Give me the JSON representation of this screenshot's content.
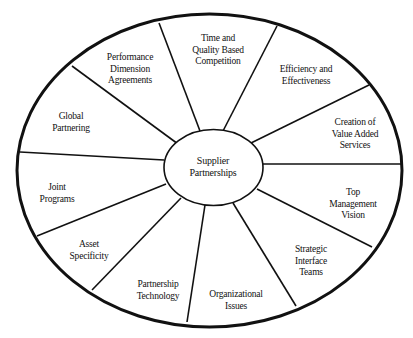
{
  "diagram": {
    "type": "wheel",
    "stroke_color": "#111111",
    "background": "#ffffff",
    "outer_ellipse": {
      "cx": 209.5,
      "cy": 170.5,
      "rx": 192.5,
      "ry": 156.5
    },
    "inner_ellipse": {
      "cx": 213.5,
      "cy": 167.5,
      "rx": 49.5,
      "ry": 38
    },
    "center": {
      "lines": [
        "Supplier",
        "Partnerships"
      ],
      "x": 213,
      "y": 167
    },
    "segments": [
      {
        "id": "time-quality",
        "lines": [
          "Time and",
          "Quality Based",
          "Competition"
        ],
        "x": 218,
        "y": 50
      },
      {
        "id": "efficiency",
        "lines": [
          "Efficiency and",
          "Effectiveness"
        ],
        "x": 306,
        "y": 75
      },
      {
        "id": "value-added",
        "lines": [
          "Creation of",
          "Value Added",
          "Services"
        ],
        "x": 355,
        "y": 134
      },
      {
        "id": "top-management",
        "lines": [
          "Top",
          "Management",
          "Vision"
        ],
        "x": 353,
        "y": 204
      },
      {
        "id": "strategic-interface",
        "lines": [
          "Strategic",
          "Interface",
          "Teams"
        ],
        "x": 311,
        "y": 261
      },
      {
        "id": "organizational",
        "lines": [
          "Organizational",
          "Issues"
        ],
        "x": 236,
        "y": 300
      },
      {
        "id": "partnership-technology",
        "lines": [
          "Partnership",
          "Technology"
        ],
        "x": 158,
        "y": 290
      },
      {
        "id": "asset-specificity",
        "lines": [
          "Asset",
          "Specificity"
        ],
        "x": 89,
        "y": 250
      },
      {
        "id": "joint-programs",
        "lines": [
          "Joint",
          "Programs"
        ],
        "x": 57,
        "y": 193
      },
      {
        "id": "global-partnering",
        "lines": [
          "Global",
          "Partnering"
        ],
        "x": 71,
        "y": 122
      },
      {
        "id": "performance-dimension",
        "lines": [
          "Performance",
          "Dimension",
          "Agreements"
        ],
        "x": 130,
        "y": 69
      }
    ],
    "spokes": [
      {
        "x1": 72,
        "y1": 66,
        "x2": 178,
        "y2": 144
      },
      {
        "x1": 159,
        "y1": 23,
        "x2": 200,
        "y2": 131
      },
      {
        "x1": 277,
        "y1": 26,
        "x2": 223,
        "y2": 131
      },
      {
        "x1": 369,
        "y1": 85,
        "x2": 251,
        "y2": 143
      },
      {
        "x1": 402,
        "y1": 164,
        "x2": 263,
        "y2": 164
      },
      {
        "x1": 372,
        "y1": 247,
        "x2": 257,
        "y2": 189
      },
      {
        "x1": 296,
        "y1": 306,
        "x2": 233,
        "y2": 203
      },
      {
        "x1": 187,
        "y1": 322,
        "x2": 205,
        "y2": 205
      },
      {
        "x1": 92,
        "y1": 290,
        "x2": 181,
        "y2": 198
      },
      {
        "x1": 37,
        "y1": 236,
        "x2": 166,
        "y2": 184
      },
      {
        "x1": 20,
        "y1": 152,
        "x2": 164,
        "y2": 160
      }
    ]
  }
}
